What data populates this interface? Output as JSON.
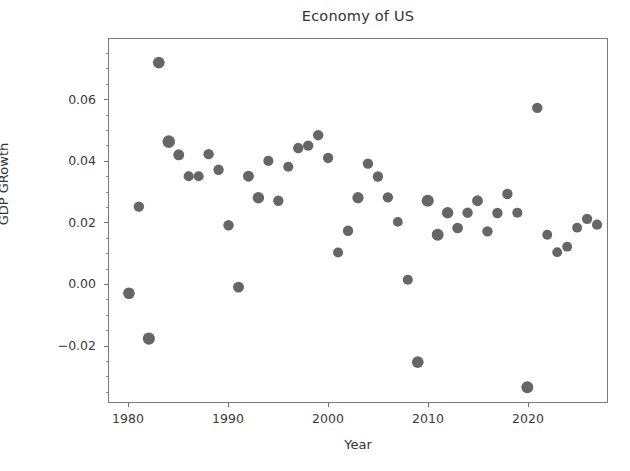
{
  "chart_data": {
    "type": "scatter",
    "title": "Economy of US",
    "xlabel": "Year",
    "ylabel": "GDP GRowth",
    "grid": false,
    "legend": null,
    "xlim": [
      1978.0,
      2028.0
    ],
    "ylim": [
      -0.0385,
      0.08
    ],
    "xticks": [
      1980,
      1990,
      2000,
      2010,
      2020
    ],
    "xtick_labels": [
      "1980",
      "1990",
      "2000",
      "2010",
      "2020"
    ],
    "yticks": [
      -0.02,
      0.0,
      0.02,
      0.04,
      0.06
    ],
    "ytick_labels": [
      "−0.02",
      "0.00",
      "0.02",
      "0.04",
      "0.06"
    ],
    "marker_color": "#595959",
    "marker_shape": "circle",
    "x": [
      1980,
      1981,
      1982,
      1983,
      1984,
      1985,
      1986,
      1987,
      1988,
      1989,
      1990,
      1991,
      1992,
      1993,
      1994,
      1995,
      1996,
      1997,
      1998,
      1999,
      2000,
      2001,
      2002,
      2003,
      2004,
      2005,
      2006,
      2007,
      2008,
      2009,
      2010,
      2011,
      2012,
      2013,
      2014,
      2015,
      2016,
      2017,
      2018,
      2019,
      2020,
      2021,
      2022,
      2023,
      2024,
      2025,
      2026,
      2027
    ],
    "y": [
      -0.003,
      0.0253,
      -0.0178,
      0.0723,
      0.0465,
      0.0422,
      0.0352,
      0.0352,
      0.0424,
      0.0373,
      0.0192,
      -0.001,
      0.0352,
      0.0282,
      0.0402,
      0.0272,
      0.0383,
      0.0444,
      0.0452,
      0.0486,
      0.0412,
      0.0103,
      0.0174,
      0.0282,
      0.0393,
      0.0351,
      0.0283,
      0.0203,
      0.0014,
      -0.0255,
      0.0272,
      0.0161,
      0.0233,
      0.0183,
      0.0233,
      0.0272,
      0.0172,
      0.0232,
      0.0294,
      0.0233,
      -0.0337,
      0.0575,
      0.0161,
      0.0104,
      0.0122,
      0.0184,
      0.0213,
      0.0194
    ],
    "sizes": [
      120,
      95,
      130,
      120,
      140,
      105,
      90,
      90,
      95,
      95,
      95,
      105,
      105,
      115,
      90,
      95,
      90,
      95,
      95,
      95,
      95,
      90,
      95,
      110,
      95,
      95,
      95,
      85,
      90,
      120,
      130,
      125,
      115,
      100,
      95,
      105,
      95,
      95,
      95,
      90,
      125,
      95,
      85,
      85,
      85,
      85,
      95,
      90
    ]
  }
}
